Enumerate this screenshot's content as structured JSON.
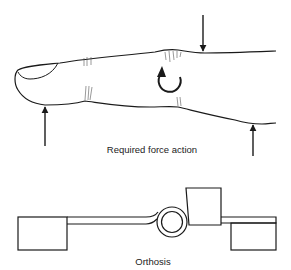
{
  "figure": {
    "top_panel": {
      "caption": "Required force action",
      "elements": [
        "finger-outline",
        "downward-force-arrow",
        "upward-force-arrow-left",
        "upward-force-arrow-right",
        "rotation-arrow"
      ]
    },
    "bottom_panel": {
      "caption": "Orthosis",
      "elements": [
        "left-pad",
        "left-bar",
        "hinge-joint",
        "upper-pad",
        "right-bar",
        "lower-pad"
      ]
    },
    "colors": {
      "line": "#1a1a1a",
      "background": "#ffffff"
    }
  }
}
